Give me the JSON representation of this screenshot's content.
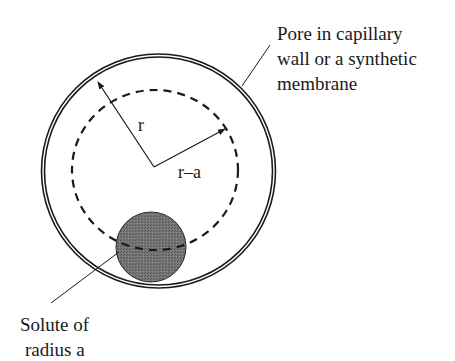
{
  "diagram": {
    "type": "pore-solute-schematic",
    "pore_label": {
      "lines": [
        "Pore in capillary",
        "wall or a synthetic",
        "membrane"
      ]
    },
    "solute_label": {
      "lines": [
        "Solute of",
        "radius a"
      ]
    },
    "radius_labels": {
      "outer": "r",
      "inner": "r–a"
    },
    "colors": {
      "stroke": "#1a1a1a",
      "solute_fill": "#6e6e6e",
      "background": "#ffffff"
    }
  }
}
